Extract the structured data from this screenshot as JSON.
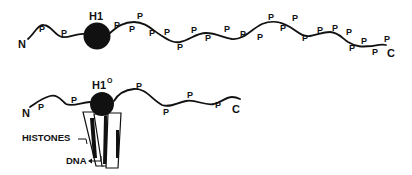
{
  "diagram": {
    "top_molecule": {
      "name": "H1",
      "n_terminus_label": "N",
      "c_terminus_label": "C",
      "head_label": "H1",
      "phospho_label": "P",
      "phospho_count": 24,
      "p_sites": [
        {
          "x": 42,
          "y": 30
        },
        {
          "x": 63,
          "y": 33
        },
        {
          "x": 116,
          "y": 26
        },
        {
          "x": 130,
          "y": 30
        },
        {
          "x": 139,
          "y": 18
        },
        {
          "x": 151,
          "y": 35
        },
        {
          "x": 166,
          "y": 34
        },
        {
          "x": 180,
          "y": 47
        },
        {
          "x": 193,
          "y": 32
        },
        {
          "x": 207,
          "y": 30
        },
        {
          "x": 207,
          "y": 38
        },
        {
          "x": 226,
          "y": 30
        },
        {
          "x": 243,
          "y": 35
        },
        {
          "x": 260,
          "y": 38
        },
        {
          "x": 270,
          "y": 19
        },
        {
          "x": 282,
          "y": 28
        },
        {
          "x": 294,
          "y": 20
        },
        {
          "x": 305,
          "y": 38
        },
        {
          "x": 320,
          "y": 30
        },
        {
          "x": 334,
          "y": 29
        },
        {
          "x": 349,
          "y": 33
        },
        {
          "x": 352,
          "y": 48
        },
        {
          "x": 364,
          "y": 42
        },
        {
          "x": 375,
          "y": 52
        },
        {
          "x": 387,
          "y": 40
        }
      ]
    },
    "bottom_molecule": {
      "name": "H1 zero",
      "n_terminus_label": "N",
      "c_terminus_label": "C",
      "head_label": "H1",
      "head_superscript": "O",
      "phospho_label": "P",
      "p_sites": [
        {
          "x": 40,
          "y": 108
        },
        {
          "x": 73,
          "y": 101
        },
        {
          "x": 136,
          "y": 87
        },
        {
          "x": 165,
          "y": 113
        },
        {
          "x": 188,
          "y": 97
        },
        {
          "x": 217,
          "y": 106
        }
      ],
      "labels": {
        "histones": "HISTONES",
        "dna": "DNA"
      }
    }
  }
}
